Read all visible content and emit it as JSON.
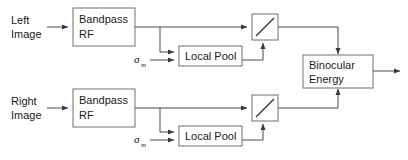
{
  "diagram": {
    "background_color": "#ffffff",
    "line_color": "#4a4a4a",
    "box_stroke_color": "#6e6e6e",
    "text_color": "#1a1a1a"
  },
  "inputs": {
    "left": {
      "line1": "Left",
      "line2": "Image"
    },
    "right": {
      "line1": "Right",
      "line2": "Image"
    }
  },
  "blocks": {
    "bandpass_top": {
      "line1": "Bandpass",
      "line2": "RF"
    },
    "bandpass_bottom": {
      "line1": "Bandpass",
      "line2": "RF"
    },
    "local_pool_top": {
      "label": "Local Pool"
    },
    "local_pool_bottom": {
      "label": "Local Pool"
    },
    "divider_top": {
      "label": "",
      "glyph": "diagonal-slash"
    },
    "divider_bottom": {
      "label": "",
      "glyph": "diagonal-slash"
    },
    "binocular_energy": {
      "line1": "Binocular",
      "line2": "Energy"
    }
  },
  "parameters": {
    "sigma_top": {
      "symbol": "σ",
      "subscript": "m"
    },
    "sigma_bottom": {
      "symbol": "σ",
      "subscript": "m"
    }
  }
}
